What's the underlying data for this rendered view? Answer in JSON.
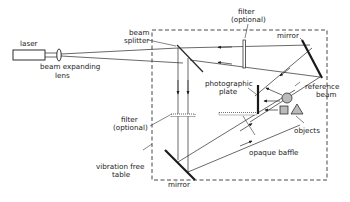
{
  "diagram": {
    "labels": {
      "laser": "laser",
      "beam_expanding_lens_1": "beam expanding",
      "beam_expanding_lens_2": "lens",
      "beam_splitter_1": "beam",
      "beam_splitter_2": "splitter",
      "filter_top_1": "filter",
      "filter_top_2": "(optional)",
      "mirror_top": "mirror",
      "photographic_plate_1": "photographic",
      "photographic_plate_2": "plate",
      "reference_beam_1": "reference",
      "reference_beam_2": "beam",
      "filter_left_1": "filter",
      "filter_left_2": "(optional)",
      "objects": "objects",
      "opaque_baffle": "opaque baffle",
      "vibration_table_1": "vibration free",
      "vibration_table_2": "table",
      "mirror_bottom": "mirror"
    },
    "colors": {
      "ink": "#1a1a1a",
      "background": "#ffffff"
    }
  }
}
